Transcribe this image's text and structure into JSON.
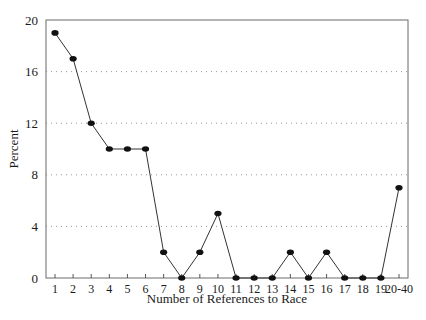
{
  "chart_data": {
    "type": "line",
    "title": "",
    "xlabel": "Number of References to Race",
    "ylabel": "Percent",
    "categories": [
      "1",
      "2",
      "3",
      "4",
      "5",
      "6",
      "7",
      "8",
      "9",
      "10",
      "11",
      "12",
      "13",
      "14",
      "15",
      "16",
      "17",
      "18",
      "19",
      "20-40"
    ],
    "values": [
      19,
      17,
      12,
      10,
      10,
      10,
      2,
      0,
      2,
      5,
      0,
      0,
      0,
      2,
      0,
      2,
      0,
      0,
      0,
      7
    ],
    "ylim": [
      0,
      20
    ],
    "yticks": [
      0,
      4,
      8,
      12,
      16,
      20
    ],
    "grid": "horizontal dotted",
    "legend": null,
    "colors": {
      "line": "#333333",
      "marker": "#111111",
      "grid": "#999999",
      "axis": "#555555"
    }
  }
}
